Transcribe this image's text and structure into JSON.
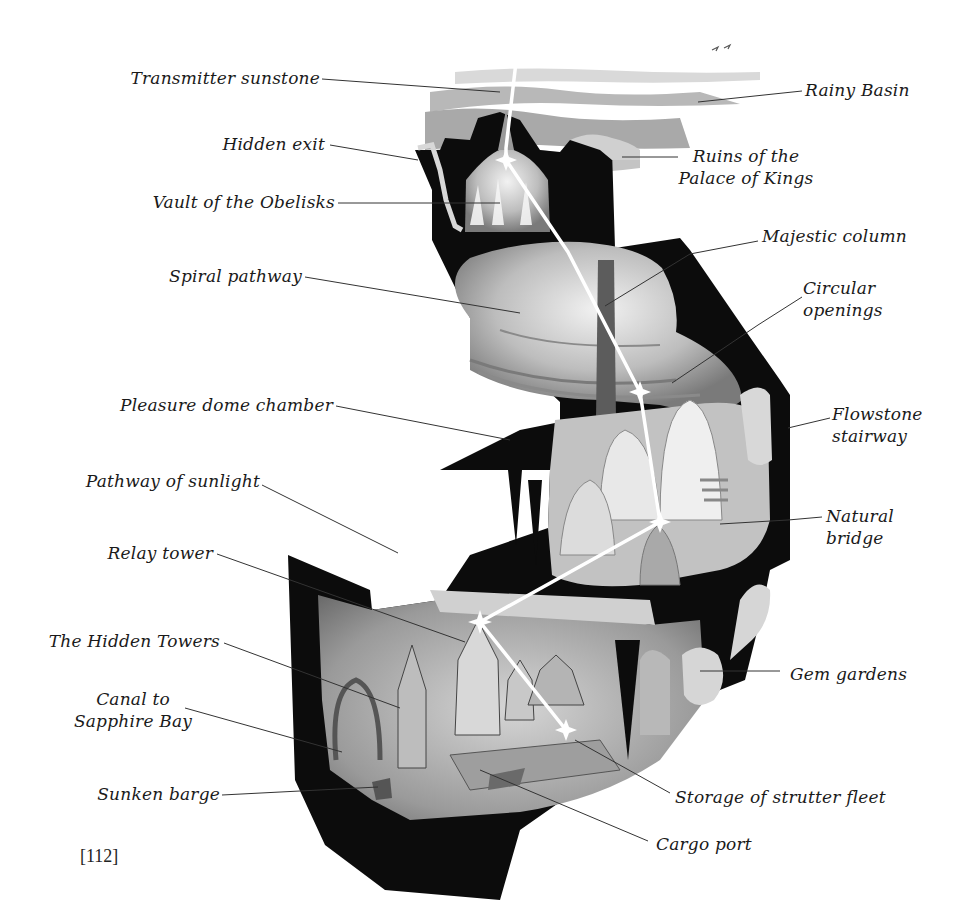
{
  "figure": {
    "page_number": "[112]",
    "colors": {
      "rock": "#0c0c0c",
      "cavern_light": "#e4e4e4",
      "cavern_mid": "#a8a8a8",
      "cavern_dark": "#6e6e6e",
      "sky_wash": "#bdbdbd",
      "light_beam": "#ffffff",
      "leader_line": "#333333",
      "label_text": "#1a1a1a"
    },
    "labels_left": [
      {
        "id": "transmitter-sunstone",
        "text": "Transmitter sunstone"
      },
      {
        "id": "hidden-exit",
        "text": "Hidden exit"
      },
      {
        "id": "vault-of-the-obelisks",
        "text": "Vault of the Obelisks"
      },
      {
        "id": "spiral-pathway",
        "text": "Spiral pathway"
      },
      {
        "id": "pleasure-dome-chamber",
        "text": "Pleasure dome chamber"
      },
      {
        "id": "pathway-of-sunlight",
        "text": "Pathway of sunlight"
      },
      {
        "id": "relay-tower",
        "text": "Relay tower"
      },
      {
        "id": "the-hidden-towers",
        "text": "The Hidden Towers"
      },
      {
        "id": "canal-to-sapphire-bay",
        "line1": "Canal to",
        "line2": "Sapphire Bay"
      },
      {
        "id": "sunken-barge",
        "text": "Sunken barge"
      }
    ],
    "labels_right": [
      {
        "id": "rainy-basin",
        "text": "Rainy Basin"
      },
      {
        "id": "ruins-of-the-palace-of-kings",
        "line1": "Ruins of the",
        "line2": "Palace of Kings"
      },
      {
        "id": "majestic-column",
        "text": "Majestic column"
      },
      {
        "id": "circular-openings",
        "line1": "Circular",
        "line2": "openings"
      },
      {
        "id": "flowstone-stairway",
        "line1": "Flowstone",
        "line2": "stairway"
      },
      {
        "id": "natural-bridge",
        "line1": "Natural",
        "line2": "bridge"
      },
      {
        "id": "gem-gardens",
        "text": "Gem gardens"
      },
      {
        "id": "storage-of-strutter-fleet",
        "text": "Storage of strutter fleet"
      },
      {
        "id": "cargo-port",
        "text": "Cargo port"
      }
    ]
  }
}
